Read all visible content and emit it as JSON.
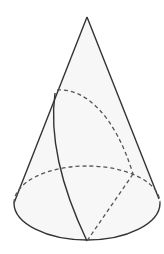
{
  "diagram": {
    "title": "",
    "type": "cone-with-helical-path",
    "colors": {
      "background": "#ffffff",
      "fill": "#f7f7f7",
      "stroke": "#333333",
      "dashed": "#555555"
    },
    "apex": [
      87,
      17
    ],
    "base": {
      "cx": 87,
      "cy": 203,
      "rx": 73,
      "ry": 37
    },
    "elements": [
      {
        "name": "left-generatrix",
        "style": "solid"
      },
      {
        "name": "right-generatrix",
        "style": "solid"
      },
      {
        "name": "base-front-arc",
        "style": "solid"
      },
      {
        "name": "base-back-arc",
        "style": "dashed"
      },
      {
        "name": "hidden-curve-arc",
        "style": "dashed"
      },
      {
        "name": "visible-curve",
        "style": "solid"
      },
      {
        "name": "hidden-radius-line",
        "style": "dashed"
      }
    ]
  }
}
